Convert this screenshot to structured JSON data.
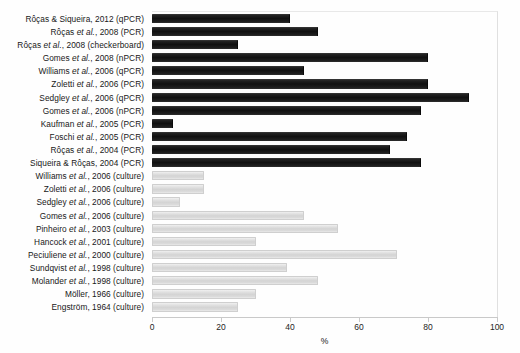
{
  "chart_data": {
    "type": "bar",
    "orientation": "horizontal",
    "title": "",
    "subtitle": "",
    "xlabel": "%",
    "ylabel": "",
    "xlim": [
      0,
      100
    ],
    "xticks": [
      0,
      20,
      40,
      60,
      80,
      100
    ],
    "grid": false,
    "legend_position": "none",
    "colors": {
      "molecular_bar": "#141414",
      "culture_bar": "#d9d9d9",
      "axis_line": "#c9c9c9",
      "text": "#1a1a1a",
      "background": "#fefefe"
    },
    "series": [
      {
        "name": "Molecular (PCR / qPCR / nPCR / checkerboard)",
        "color": "#141414",
        "style": "pcr"
      },
      {
        "name": "Culture",
        "color": "#d9d9d9",
        "style": "culture"
      }
    ],
    "categories": [
      "Rôças & Siqueira, 2012 (qPCR)",
      "Rôças et al., 2008 (PCR)",
      "Rôças et al., 2008 (checkerboard)",
      "Gomes et al., 2008 (nPCR)",
      "Williams et al., 2006 (qPCR)",
      "Zoletti et al., 2006 (PCR)",
      "Sedgley et al., 2006 (qPCR)",
      "Gomes et al., 2006 (nPCR)",
      "Kaufman et al., 2005 (PCR)",
      "Foschi et al., 2005 (PCR)",
      "Rôças et al., 2004 (PCR)",
      "Siqueira & Rôças, 2004 (PCR)",
      "Williams et al., 2006 (culture)",
      "Zoletti et al., 2006 (culture)",
      "Sedgley et al., 2006 (culture)",
      "Gomes et al., 2006 (culture)",
      "Pinheiro et al., 2003 (culture)",
      "Hancock et al., 2001 (culture)",
      "Peciuliene et al., 2000 (culture)",
      "Sundqvist et al., 1998 (culture)",
      "Molander et al., 1998 (culture)",
      "Möller, 1966 (culture)",
      "Engström, 1964 (culture)"
    ],
    "values": [
      40,
      48,
      25,
      80,
      44,
      80,
      92,
      78,
      6,
      74,
      69,
      78,
      15,
      15,
      8,
      44,
      54,
      30,
      71,
      39,
      48,
      30,
      25
    ],
    "bars": [
      {
        "label_main": "Rôças & Siqueira, 2012 (qPCR)",
        "label_pre": "Rôças & Siqueira, 2012 (qPCR)",
        "label_it": "",
        "label_post": "",
        "value": 40,
        "group": "pcr"
      },
      {
        "label_main": "Rôças et al., 2008 (PCR)",
        "label_pre": "Rôças ",
        "label_it": "et al.",
        "label_post": ", 2008 (PCR)",
        "value": 48,
        "group": "pcr"
      },
      {
        "label_main": "Rôças et al., 2008 (checkerboard)",
        "label_pre": "Rôças ",
        "label_it": "et al.",
        "label_post": ", 2008 (checkerboard)",
        "value": 25,
        "group": "pcr"
      },
      {
        "label_main": "Gomes et al., 2008 (nPCR)",
        "label_pre": "Gomes ",
        "label_it": "et al.",
        "label_post": ", 2008 (nPCR)",
        "value": 80,
        "group": "pcr"
      },
      {
        "label_main": "Williams et al., 2006 (qPCR)",
        "label_pre": "Williams ",
        "label_it": "et al.",
        "label_post": ", 2006 (qPCR)",
        "value": 44,
        "group": "pcr"
      },
      {
        "label_main": "Zoletti et al., 2006 (PCR)",
        "label_pre": "Zoletti ",
        "label_it": "et al.",
        "label_post": ", 2006 (PCR)",
        "value": 80,
        "group": "pcr"
      },
      {
        "label_main": "Sedgley et al., 2006 (qPCR)",
        "label_pre": "Sedgley ",
        "label_it": "et al.",
        "label_post": ", 2006 (qPCR)",
        "value": 92,
        "group": "pcr"
      },
      {
        "label_main": "Gomes et al., 2006 (nPCR)",
        "label_pre": "Gomes ",
        "label_it": "et al.",
        "label_post": ", 2006 (nPCR)",
        "value": 78,
        "group": "pcr"
      },
      {
        "label_main": "Kaufman et al., 2005 (PCR)",
        "label_pre": "Kaufman ",
        "label_it": "et al.",
        "label_post": ", 2005 (PCR)",
        "value": 6,
        "group": "pcr"
      },
      {
        "label_main": "Foschi et al., 2005 (PCR)",
        "label_pre": "Foschi ",
        "label_it": "et al.",
        "label_post": ", 2005 (PCR)",
        "value": 74,
        "group": "pcr"
      },
      {
        "label_main": "Rôças et al., 2004 (PCR)",
        "label_pre": "Rôças ",
        "label_it": "et al.",
        "label_post": ", 2004 (PCR)",
        "value": 69,
        "group": "pcr"
      },
      {
        "label_main": "Siqueira & Rôças, 2004 (PCR)",
        "label_pre": "Siqueira & Rôças, 2004 (PCR)",
        "label_it": "",
        "label_post": "",
        "value": 78,
        "group": "pcr"
      },
      {
        "label_main": "Williams et al., 2006 (culture)",
        "label_pre": "Williams ",
        "label_it": "et al.",
        "label_post": ", 2006 (culture)",
        "value": 15,
        "group": "culture"
      },
      {
        "label_main": "Zoletti et al., 2006 (culture)",
        "label_pre": "Zoletti ",
        "label_it": "et al.",
        "label_post": ", 2006 (culture)",
        "value": 15,
        "group": "culture"
      },
      {
        "label_main": "Sedgley et al., 2006 (culture)",
        "label_pre": "Sedgley ",
        "label_it": "et al.",
        "label_post": ", 2006 (culture)",
        "value": 8,
        "group": "culture"
      },
      {
        "label_main": "Gomes et al., 2006 (culture)",
        "label_pre": "Gomes ",
        "label_it": "et al.",
        "label_post": ", 2006 (culture)",
        "value": 44,
        "group": "culture"
      },
      {
        "label_main": "Pinheiro et al., 2003 (culture)",
        "label_pre": "Pinheiro ",
        "label_it": "et al.",
        "label_post": ", 2003 (culture)",
        "value": 54,
        "group": "culture"
      },
      {
        "label_main": "Hancock et al., 2001 (culture)",
        "label_pre": "Hancock ",
        "label_it": "et al.",
        "label_post": ", 2001 (culture)",
        "value": 30,
        "group": "culture"
      },
      {
        "label_main": "Peciuliene et al., 2000 (culture)",
        "label_pre": "Peciuliene ",
        "label_it": "et al.",
        "label_post": ", 2000 (culture)",
        "value": 71,
        "group": "culture"
      },
      {
        "label_main": "Sundqvist et al., 1998 (culture)",
        "label_pre": "Sundqvist ",
        "label_it": "et al.",
        "label_post": ", 1998 (culture)",
        "value": 39,
        "group": "culture"
      },
      {
        "label_main": "Molander et al., 1998 (culture)",
        "label_pre": "Molander ",
        "label_it": "et al.",
        "label_post": ", 1998 (culture)",
        "value": 48,
        "group": "culture"
      },
      {
        "label_main": "Möller, 1966 (culture)",
        "label_pre": "Möller, 1966 (culture)",
        "label_it": "",
        "label_post": "",
        "value": 30,
        "group": "culture"
      },
      {
        "label_main": "Engström, 1964 (culture)",
        "label_pre": "Engström, 1964 (culture)",
        "label_it": "",
        "label_post": "",
        "value": 25,
        "group": "culture"
      }
    ]
  }
}
